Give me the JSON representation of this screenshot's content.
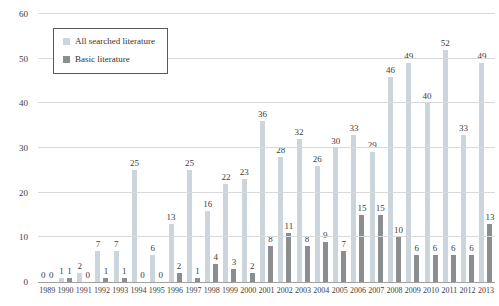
{
  "chart_data": {
    "type": "bar",
    "title": "",
    "xlabel": "",
    "ylabel": "",
    "categories": [
      "1989",
      "1990",
      "1991",
      "1992",
      "1993",
      "1994",
      "1995",
      "1996",
      "1997",
      "1998",
      "1999",
      "2000",
      "2001",
      "2002",
      "2003",
      "2004",
      "2005",
      "2006",
      "2007",
      "2008",
      "2009",
      "2010",
      "2011",
      "2012",
      "2013"
    ],
    "series": [
      {
        "name": "All searched literature",
        "color": "#ccd5dc",
        "values": [
          0,
          1,
          2,
          7,
          7,
          25,
          6,
          13,
          25,
          16,
          22,
          23,
          36,
          28,
          32,
          26,
          30,
          33,
          29,
          46,
          49,
          40,
          52,
          33,
          49
        ]
      },
      {
        "name": "Basic literature",
        "color": "#8a8e91",
        "values": [
          0,
          1,
          0,
          1,
          1,
          0,
          0,
          2,
          1,
          4,
          3,
          2,
          8,
          11,
          8,
          9,
          7,
          15,
          15,
          10,
          6,
          6,
          6,
          6,
          13
        ]
      }
    ],
    "ylim": [
      0,
      60
    ],
    "yticks": [
      0,
      10,
      20,
      30,
      40,
      50,
      60
    ],
    "grid": true,
    "value_labels": true,
    "legend_position": "upper-left",
    "colors": {
      "background": "#ffffff",
      "gridline": "#d9d9d9",
      "axis_line": "#a0a0a0",
      "text": "#404040"
    }
  }
}
